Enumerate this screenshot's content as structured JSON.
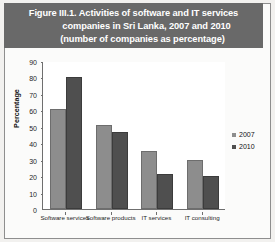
{
  "figure": {
    "title_lines": [
      "Figure III.1. Activities of software and IT services",
      "companies in Sri Lanka, 2007 and 2010",
      "(number of companies as percentage)"
    ],
    "banner_color": "#696969"
  },
  "chart_data": {
    "type": "bar",
    "title": "Figure III.1. Activities of software and IT services companies in Sri Lanka, 2007 and 2010 (number of companies as percentage)",
    "xlabel": "",
    "ylabel": "Percentage",
    "ylim": [
      0,
      90
    ],
    "yticks": [
      0,
      10,
      20,
      30,
      40,
      50,
      60,
      70,
      80,
      90
    ],
    "grid": false,
    "legend_position": "right",
    "categories": [
      "Software services",
      "Software products",
      "IT services",
      "IT consulting"
    ],
    "series": [
      {
        "name": "2007",
        "color": "#8d8d8d",
        "values": [
          61,
          51,
          35,
          30
        ]
      },
      {
        "name": "2010",
        "color": "#4f4f4f",
        "values": [
          80,
          47,
          21,
          20
        ]
      }
    ]
  }
}
